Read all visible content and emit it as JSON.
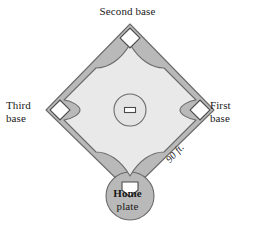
{
  "figure": {
    "labels": {
      "second_base": "Second base",
      "third_base_line1": "Third",
      "third_base_line2": "base",
      "first_base_line1": "First",
      "first_base_line2": "base",
      "home_plate_line1": "Home",
      "home_plate_line2": "plate",
      "distance": "90 ft."
    },
    "colors": {
      "background": "#ffffff",
      "dirt": "#b9b9b9",
      "infield_grass": "#e9e9e9",
      "base_white": "#ffffff",
      "outline": "#555555",
      "text": "#1a1a1a"
    },
    "geometry": {
      "diamond_top_x": 130,
      "diamond_top_y": 24,
      "diamond_left_x": 46,
      "diamond_left_y": 110,
      "diamond_right_x": 214,
      "diamond_right_y": 110,
      "diamond_bottom_x": 130,
      "diamond_bottom_y": 192,
      "mound_center_x": 130,
      "mound_center_y": 110,
      "mound_radius": 16,
      "home_circle_center_x": 130,
      "home_circle_center_y": 196,
      "home_circle_radius": 24
    }
  }
}
